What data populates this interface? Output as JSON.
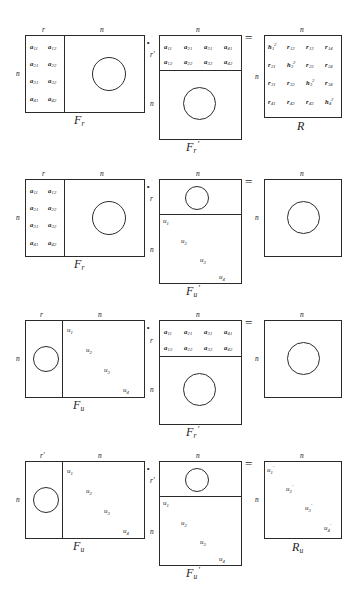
{
  "figure": {
    "type": "matrix-factorization-diagram",
    "ink_color": "#2b2b2b",
    "background": "#ffffff",
    "operators": {
      "multiply": "·",
      "equals": "="
    }
  },
  "labels": {
    "r": "r",
    "r_prime": "r'",
    "n": "n"
  },
  "rows": [
    {
      "id": "row-1",
      "equation": "F_r · F_r' = R",
      "left": {
        "caption": "F",
        "caption_sub": "r",
        "caption_sup": "",
        "top_labels": [
          "r",
          "n"
        ],
        "left_label": "n",
        "entries": [
          [
            "a",
            "11"
          ],
          [
            "a",
            "12"
          ],
          [
            "a",
            "21"
          ],
          [
            "a",
            "22"
          ],
          [
            "a",
            "31"
          ],
          [
            "a",
            "32"
          ],
          [
            "a",
            "41"
          ],
          [
            "a",
            "42"
          ]
        ],
        "has_circle": true
      },
      "middle": {
        "caption": "F",
        "caption_sub": "r",
        "caption_sup": "'",
        "top_labels": [
          "n"
        ],
        "left_labels": [
          "r",
          "n"
        ],
        "entries": [
          [
            "a",
            "11"
          ],
          [
            "a",
            "21"
          ],
          [
            "a",
            "31"
          ],
          [
            "a",
            "41"
          ],
          [
            "a",
            "12"
          ],
          [
            "a",
            "22"
          ],
          [
            "a",
            "32"
          ],
          [
            "a",
            "42"
          ]
        ],
        "has_circle": true
      },
      "right": {
        "caption": "R",
        "caption_sub": "",
        "caption_sup": "",
        "top_labels": [
          "n"
        ],
        "left_label": "n",
        "entries": [
          [
            "h",
            "1",
            "2"
          ],
          [
            "r",
            "12",
            ""
          ],
          [
            "r",
            "13",
            ""
          ],
          [
            "r",
            "14",
            ""
          ],
          [
            "r",
            "21",
            ""
          ],
          [
            "h",
            "2",
            "2"
          ],
          [
            "r",
            "23",
            ""
          ],
          [
            "r",
            "24",
            ""
          ],
          [
            "r",
            "31",
            ""
          ],
          [
            "r",
            "32",
            ""
          ],
          [
            "h",
            "3",
            "2"
          ],
          [
            "r",
            "34",
            ""
          ],
          [
            "r",
            "41",
            ""
          ],
          [
            "r",
            "42",
            ""
          ],
          [
            "r",
            "43",
            ""
          ],
          [
            "h",
            "4",
            "2"
          ]
        ]
      }
    },
    {
      "id": "row-2",
      "equation": "F_r · F_u' = (n × n)",
      "left": {
        "caption": "F",
        "caption_sub": "r",
        "caption_sup": "",
        "top_labels": [
          "r",
          "n"
        ],
        "left_label": "n",
        "entries": [
          [
            "a",
            "11"
          ],
          [
            "a",
            "12"
          ],
          [
            "a",
            "21"
          ],
          [
            "a",
            "22"
          ],
          [
            "a",
            "31"
          ],
          [
            "a",
            "32"
          ],
          [
            "a",
            "41"
          ],
          [
            "a",
            "42"
          ]
        ],
        "has_circle": true
      },
      "middle": {
        "caption": "F",
        "caption_sub": "u",
        "caption_sup": "'",
        "top_labels": [
          "n"
        ],
        "left_labels": [
          "r",
          "n"
        ],
        "diagonal": [
          "u₁",
          "u₂",
          "u₃",
          "u₄"
        ],
        "has_circle": true
      },
      "right": {
        "caption": "",
        "caption_sub": "",
        "caption_sup": "",
        "top_labels": [
          "n"
        ],
        "left_label": "n",
        "has_circle": true
      }
    },
    {
      "id": "row-3",
      "equation": "F_u · F_r' = (n × n)",
      "left": {
        "caption": "F",
        "caption_sub": "u",
        "caption_sup": "",
        "top_labels": [
          "r",
          "n"
        ],
        "left_label": "n",
        "diagonal": [
          "u₁",
          "u₂",
          "u₃",
          "u₄"
        ],
        "has_circle": true
      },
      "middle": {
        "caption": "F",
        "caption_sub": "r",
        "caption_sup": "'",
        "top_labels": [
          "n"
        ],
        "left_labels": [
          "r",
          "n"
        ],
        "entries": [
          [
            "a",
            "11"
          ],
          [
            "a",
            "21"
          ],
          [
            "a",
            "31"
          ],
          [
            "a",
            "41"
          ],
          [
            "a",
            "12"
          ],
          [
            "a",
            "22"
          ],
          [
            "a",
            "32"
          ],
          [
            "a",
            "42"
          ]
        ],
        "has_circle": true
      },
      "right": {
        "caption": "",
        "caption_sub": "",
        "caption_sup": "",
        "top_labels": [
          "n"
        ],
        "left_label": "n",
        "has_circle": true
      }
    },
    {
      "id": "row-4",
      "equation": "F_u · F_u' = R_u",
      "left": {
        "caption": "F",
        "caption_sub": "u",
        "caption_sup": "",
        "top_labels": [
          "r'",
          "n"
        ],
        "left_label": "n",
        "diagonal": [
          "u₁",
          "u₂",
          "u₃",
          "u₄"
        ],
        "has_circle": true
      },
      "middle": {
        "caption": "F",
        "caption_sub": "u",
        "caption_sup": "'",
        "top_labels": [
          "n"
        ],
        "left_labels": [
          "r'",
          "n"
        ],
        "diagonal": [
          "u₁",
          "u₂",
          "u₃",
          "u₄"
        ],
        "has_circle": true
      },
      "right": {
        "caption": "R",
        "caption_sub": "u",
        "caption_sup": "",
        "top_labels": [
          "n"
        ],
        "left_label": "n",
        "diagonal": [
          "u₁'",
          "u₂'",
          "u₃'",
          "u₄'"
        ]
      }
    }
  ],
  "text": {
    "a": "a",
    "h": "h",
    "r": "r",
    "u": "u",
    "F": "F",
    "R": "R",
    "prime": "'",
    "sup2": "2",
    "dot": "·",
    "eq": "="
  }
}
